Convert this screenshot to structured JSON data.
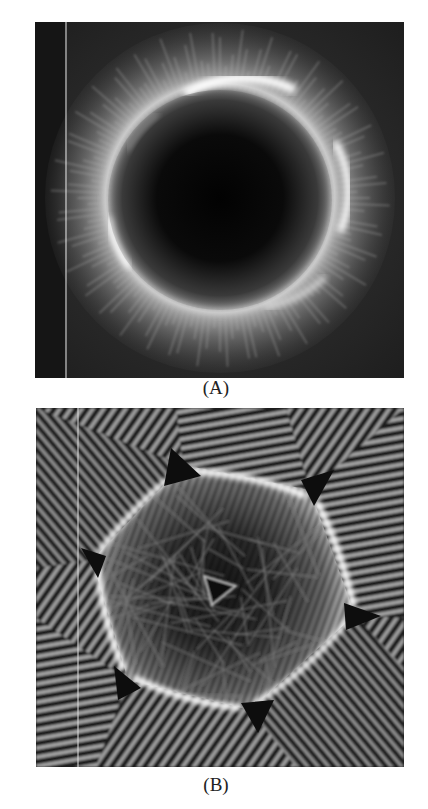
{
  "figure": {
    "panels": [
      {
        "id": "A",
        "label": "(A)",
        "description": "Grayscale intensity image: dark circular center surrounded by a bright ring with radial feathery streaks, on dark background; thin white vertical line near left edge",
        "colors": {
          "background": "#2a2a2a",
          "center": "#050505",
          "ring": "#f4f4f4"
        }
      },
      {
        "id": "B",
        "label": "(B)",
        "description": "Grayscale interference pattern: bright polygonal ring with six dark triangular cusps at vertices, dense striped fringes outside, tangled filament network with small triangle at center",
        "colors": {
          "background": "#1e1e1e",
          "ring": "#ffffff",
          "cusp": "#111111"
        }
      }
    ]
  }
}
